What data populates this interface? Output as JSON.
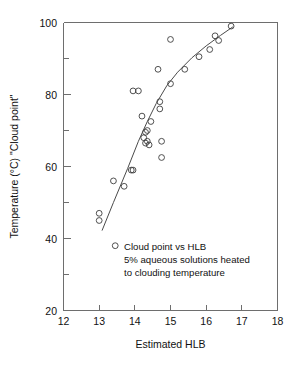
{
  "chart_data": {
    "type": "scatter",
    "title": "",
    "xlabel": "Estimated HLB",
    "ylabel": "Temperature (°C) \"Cloud point\"",
    "xlim": [
      12,
      18
    ],
    "ylim": [
      20,
      100
    ],
    "xticks": [
      12,
      13,
      14,
      15,
      16,
      17,
      18
    ],
    "xtick_labels": [
      "12",
      "13",
      "14",
      "15",
      "16",
      "17",
      "18"
    ],
    "yticks": [
      20,
      40,
      60,
      80,
      100
    ],
    "ytick_labels": [
      "20",
      "40",
      "60",
      "80",
      "100"
    ],
    "y_minor_ticks": [
      30,
      50,
      70,
      90
    ],
    "grid": false,
    "legend": null,
    "annotations": [
      "Cloud point vs HLB",
      "5% aqueous solutions heated",
      "to clouding temperature"
    ],
    "series": [
      {
        "name": "Cloud point measurements",
        "marker": "open-circle",
        "x": [
          13.0,
          13.0,
          13.45,
          13.4,
          13.7,
          13.9,
          13.95,
          13.95,
          14.1,
          14.2,
          14.25,
          14.3,
          14.3,
          14.35,
          14.35,
          14.4,
          14.45,
          14.65,
          14.7,
          14.7,
          14.75,
          14.75,
          15.0,
          15.0,
          15.4,
          15.8,
          16.1,
          16.25,
          16.35,
          16.7
        ],
        "y": [
          47.0,
          45.0,
          38.0,
          56.0,
          54.5,
          59.0,
          59.0,
          81.0,
          81.0,
          74.0,
          68.0,
          69.5,
          66.5,
          70.0,
          67.0,
          66.0,
          72.5,
          87.0,
          78.0,
          76.0,
          67.0,
          62.5,
          95.3,
          83.0,
          87.0,
          90.5,
          92.5,
          96.3,
          95.0,
          99.0
        ]
      }
    ],
    "fit_curve": {
      "name": "fitted trend line",
      "x": [
        13.08,
        13.4,
        13.8,
        14.1,
        14.35,
        14.6,
        14.9,
        15.2,
        15.6,
        16.0,
        16.4,
        16.75
      ],
      "y": [
        42.2,
        50.0,
        59.5,
        67.0,
        72.5,
        77.5,
        82.5,
        86.2,
        90.2,
        93.5,
        96.4,
        98.8
      ]
    }
  },
  "axes": {
    "x_title": "Estimated HLB",
    "y_title": "Temperature (°C) \"Cloud point\""
  }
}
